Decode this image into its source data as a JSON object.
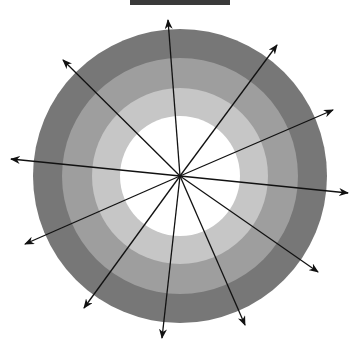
{
  "diagram": {
    "type": "concentric-rings-with-radial-arrows",
    "center": [
      180,
      176
    ],
    "rings": [
      {
        "radius": 147,
        "color": "#777777"
      },
      {
        "radius": 118,
        "color": "#9e9e9e"
      },
      {
        "radius": 88,
        "color": "#c6c6c6"
      },
      {
        "radius": 60,
        "color": "#ffffff"
      }
    ],
    "arrow_color": "#111111",
    "arrows": [
      {
        "tip": [
          168,
          20
        ]
      },
      {
        "tip": [
          277,
          45
        ]
      },
      {
        "tip": [
          333,
          110
        ]
      },
      {
        "tip": [
          348,
          193
        ]
      },
      {
        "tip": [
          318,
          272
        ]
      },
      {
        "tip": [
          245,
          325
        ]
      },
      {
        "tip": [
          162,
          338
        ]
      },
      {
        "tip": [
          84,
          308
        ]
      },
      {
        "tip": [
          25,
          244
        ]
      },
      {
        "tip": [
          11,
          159
        ]
      },
      {
        "tip": [
          63,
          60
        ]
      }
    ]
  },
  "top_bar": {
    "color": "#3a3a3a"
  }
}
